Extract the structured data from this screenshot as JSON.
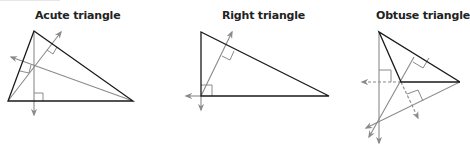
{
  "figures": [
    {
      "id": "acute",
      "title": "Acute triangle"
    },
    {
      "id": "right",
      "title": "Right triangle"
    },
    {
      "id": "obtuse",
      "title": "Obtuse triangle"
    }
  ],
  "colors": {
    "side": "#1a1a1a",
    "altitude": "#8a8a8a",
    "background": "#ffffff"
  }
}
